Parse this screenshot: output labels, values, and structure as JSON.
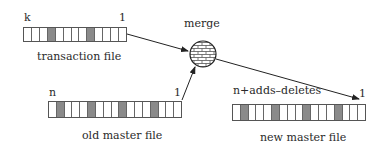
{
  "diagram": {
    "title": "merge",
    "transaction_file": {
      "label": "transaction file",
      "left_index": "k",
      "right_index": "1",
      "cell_count": 13,
      "shaded_cells": [
        4,
        9
      ]
    },
    "old_master_file": {
      "label": "old master file",
      "left_index": "n",
      "right_index": "1",
      "cell_count": 17,
      "shaded_cells": [
        2,
        6,
        10,
        14
      ]
    },
    "new_master_file": {
      "label": "new master file",
      "left_index": "n+adds–deletes",
      "right_index": "1",
      "cell_count": 17,
      "shaded_cells": [
        2,
        6,
        10,
        14
      ]
    },
    "merge_node": {
      "label": "merge",
      "icon": "brick-wall-circle"
    },
    "edges": [
      {
        "from": "transaction file",
        "to": "merge"
      },
      {
        "from": "old master file",
        "to": "merge"
      },
      {
        "from": "merge",
        "to": "new master file"
      }
    ],
    "colors": {
      "shaded_cell": "#8a8a8a",
      "line": "#222222",
      "background": "#ffffff"
    }
  }
}
